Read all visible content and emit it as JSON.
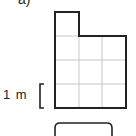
{
  "question_label": "a)",
  "scale": {
    "text": "1 m",
    "cells_per_unit": 1
  },
  "shape": {
    "grid_cols": 3,
    "grid_rows": 4,
    "filled_cells": [
      [
        0,
        0
      ],
      [
        0,
        1
      ],
      [
        1,
        1
      ],
      [
        2,
        1
      ],
      [
        0,
        2
      ],
      [
        1,
        2
      ],
      [
        2,
        2
      ],
      [
        0,
        3
      ],
      [
        1,
        3
      ],
      [
        2,
        3
      ]
    ],
    "cell_count": 10
  },
  "answer_box": {
    "value": ""
  }
}
